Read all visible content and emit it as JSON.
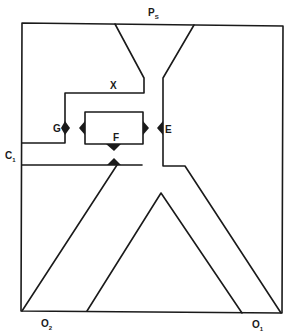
{
  "diagram": {
    "type": "fluidic-logic-element-schematic",
    "labels": {
      "supply": {
        "main": "P",
        "sub": "S"
      },
      "control": {
        "main": "C",
        "sub": "1"
      },
      "output_1": {
        "main": "O",
        "sub": "1"
      },
      "output_2": {
        "main": "O",
        "sub": "2"
      },
      "x": "X",
      "e": "E",
      "f": "F",
      "g": "G"
    },
    "colors": {
      "line": "#1a1a1a",
      "background": "#ffffff"
    }
  }
}
